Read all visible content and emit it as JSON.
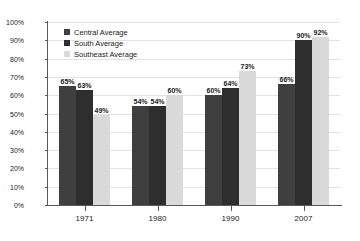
{
  "chart_data": {
    "type": "bar",
    "title": "",
    "xlabel": "",
    "ylabel": "Percent Minority",
    "ylim": [
      0,
      100
    ],
    "ytick_labels": [
      "0%",
      "10%",
      "20%",
      "30%",
      "40%",
      "50%",
      "60%",
      "70%",
      "80%",
      "90%",
      "100%"
    ],
    "ytick_values": [
      0,
      10,
      20,
      30,
      40,
      50,
      60,
      70,
      80,
      90,
      100
    ],
    "grid": true,
    "legend_position": "top-left",
    "categories": [
      "1971",
      "1980",
      "1990",
      "2007"
    ],
    "series": [
      {
        "name": "Central Average",
        "color": "#3f3f3f",
        "values": [
          65,
          54,
          60,
          66
        ],
        "labels": [
          "65%",
          "54%",
          "60%",
          "66%"
        ]
      },
      {
        "name": "South Average",
        "color": "#2e2e2e",
        "values": [
          63,
          54,
          64,
          90
        ],
        "labels": [
          "63%",
          "54%",
          "64%",
          "90%"
        ]
      },
      {
        "name": "Southeast Average",
        "color": "#d9d9d9",
        "values": [
          49,
          60,
          73,
          92
        ],
        "labels": [
          "49%",
          "60%",
          "73%",
          "92%"
        ]
      }
    ]
  }
}
